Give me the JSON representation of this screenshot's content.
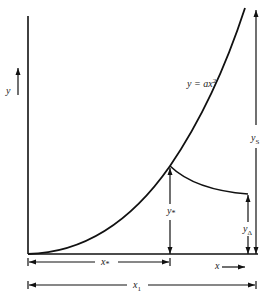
{
  "diagram": {
    "labels": {
      "y_axis": "y",
      "equation_main": "y = ax",
      "equation_exp": "2",
      "y_s_main": "y",
      "y_s_sub": "S",
      "y_star_main": "y",
      "y_star_sub": "*",
      "y_delta_main": "y",
      "y_delta_sub": "Δ",
      "x_star_main": "x",
      "x_star_sub": "*",
      "x_1_main": "x",
      "x_1_sub": "1",
      "x_axis": "x"
    }
  }
}
